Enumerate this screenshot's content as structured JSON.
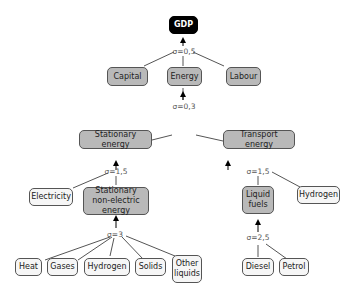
{
  "diagram": {
    "title": "GDP",
    "nodes": {
      "gdp": "GDP",
      "capital": "Capital",
      "energy": "Energy",
      "labour": "Labour",
      "stationary_energy": "Stationary energy",
      "transport_energy": "Transport energy",
      "electricity": "Electricity",
      "stationary_non_electric": "Stationary non-electric energy",
      "liquid_fuels": "Liquid fuels",
      "hydrogen_transport": "Hydrogen",
      "heat": "Heat",
      "gases": "Gases",
      "hydrogen_stationary": "Hydrogen",
      "solids": "Solids",
      "other_liquids": "Other liquids",
      "diesel": "Diesel",
      "petrol": "Petrol"
    },
    "elasticities": {
      "gdp": "σ=0,5",
      "energy": "σ=0,3",
      "stationary": "σ=1,5",
      "transport": "σ=1,5",
      "non_electric": "σ=3",
      "liquid_fuels": "σ=2,5"
    },
    "colors": {
      "aggregate_node": "#b9b9b9",
      "leaf_node": "#f6f6f6",
      "root_node": "#000000",
      "edge": "#555555"
    }
  }
}
